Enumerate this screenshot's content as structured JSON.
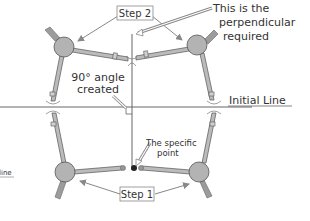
{
  "diagram": {
    "labels": {
      "step2": "Step 2",
      "step1": "Step 1",
      "perpendicular_line1": "This is the",
      "perpendicular_line2": "perpendicular",
      "perpendicular_line3": "required",
      "angle_line1": "90° angle",
      "angle_line2": "created",
      "initial_line": "Initial Line",
      "specific_line1": "The specific",
      "specific_line2": "point",
      "cut_off_text": "line"
    },
    "colors": {
      "hub": "#b3b3b3",
      "arm": "#a6a6a6",
      "outline": "#555555",
      "text": "#333333",
      "line": "#666666",
      "arrow": "#888888",
      "point": "#222222"
    },
    "compasses": [
      {
        "name": "top-left",
        "hub": [
          64,
          47
        ]
      },
      {
        "name": "top-right",
        "hub": [
          197,
          45
        ]
      },
      {
        "name": "bottom-left",
        "hub": [
          65,
          172
        ]
      },
      {
        "name": "bottom-right",
        "hub": [
          199,
          172
        ]
      }
    ]
  }
}
